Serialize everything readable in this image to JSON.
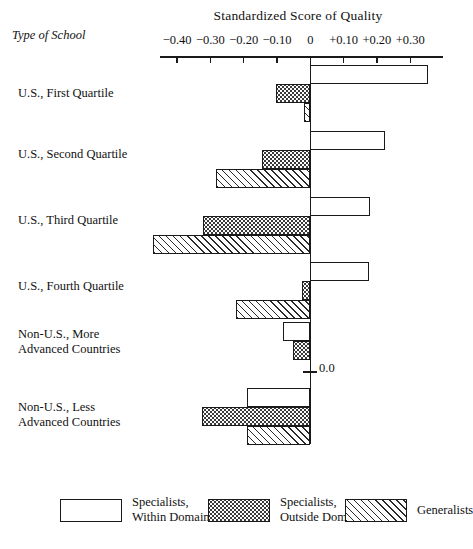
{
  "chart_data": {
    "type": "bar",
    "orientation": "horizontal",
    "title": "Standardized Score of Quality",
    "ylabel": "Type of School",
    "xlabel": "",
    "xlim": [
      -0.45,
      0.35
    ],
    "grid": false,
    "zero_annotation": "0.0",
    "legend_position": "bottom",
    "tick_labels": [
      "−0.40",
      "−0.30",
      "−0.20",
      "−0.10",
      "0",
      "+0.10",
      "+0.20",
      "+0.30"
    ],
    "tick_values": [
      -0.4,
      -0.3,
      -0.2,
      -0.1,
      0,
      0.1,
      0.2,
      0.3
    ],
    "categories": [
      "U.S., First Quartile",
      "U.S., Second Quartile",
      "U.S., Third Quartile",
      "U.S., Fourth Quartile",
      "Non-U.S., More Advanced Countries",
      "Non-U.S., Less Advanced Countries"
    ],
    "series": [
      {
        "name": "Specialists, Within Domain",
        "pattern": "white",
        "values": [
          0.355,
          0.225,
          0.18,
          0.175,
          -0.082,
          -0.19
        ]
      },
      {
        "name": "Specialists, Outside Domain",
        "pattern": "dots",
        "values": [
          -0.102,
          -0.145,
          -0.322,
          -0.025,
          -0.052,
          -0.325
        ]
      },
      {
        "name": "Generalists",
        "pattern": "hatch",
        "values": [
          -0.018,
          -0.282,
          -0.472,
          -0.223,
          null,
          -0.19
        ]
      }
    ]
  },
  "axis": {
    "ticks": [
      {
        "label": "−0.40"
      },
      {
        "label": "−0.30"
      },
      {
        "label": "−0.20"
      },
      {
        "label": "−0.10"
      },
      {
        "label": "0"
      },
      {
        "label": "+0.10"
      },
      {
        "label": "+0.20"
      },
      {
        "label": "+0.30"
      }
    ],
    "zero_label": "0.0"
  },
  "header": {
    "title": "Standardized Score of Quality",
    "ylabel": "Type of School"
  },
  "categories": [
    {
      "line1": "U.S., First Quartile",
      "line2": ""
    },
    {
      "line1": "U.S., Second Quartile",
      "line2": ""
    },
    {
      "line1": "U.S., Third Quartile",
      "line2": ""
    },
    {
      "line1": "U.S., Fourth Quartile",
      "line2": ""
    },
    {
      "line1": "Non-U.S., More",
      "line2": "Advanced Countries"
    },
    {
      "line1": "Non-U.S., Less",
      "line2": "Advanced Countries"
    }
  ],
  "legend": [
    {
      "line1": "Specialists,",
      "line2": "Within Domain",
      "pattern": "white"
    },
    {
      "line1": "Specialists,",
      "line2": "Outside Domain",
      "pattern": "dots"
    },
    {
      "line1": "Generalists",
      "line2": "",
      "pattern": "hatch"
    }
  ],
  "colors": {
    "ink": "#1a1a1a",
    "background": "#ffffff"
  }
}
